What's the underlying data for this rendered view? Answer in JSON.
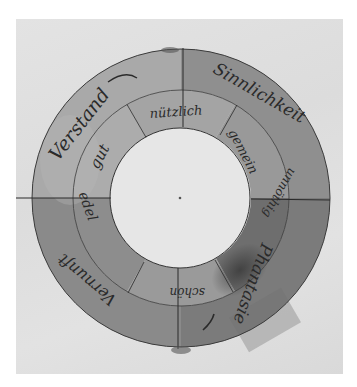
{
  "figure": {
    "center": [
      181,
      198
    ],
    "radii": {
      "inner": 70,
      "middle": 108,
      "outer": 149
    },
    "colors": {
      "paper": "#dfdfdf",
      "inner_hole": "#e6e6e6",
      "ink": "#2a2a2a"
    }
  },
  "outer_ring": {
    "labels": [
      {
        "id": "verstand",
        "text": "Verstand",
        "quadrant": "top-left",
        "shade": "#a9a9a9"
      },
      {
        "id": "sinnlichkeit",
        "text": "Sinnlichkeit",
        "quadrant": "top-right",
        "shade": "#8f8f8f"
      },
      {
        "id": "phantasie",
        "text": "Phantasie",
        "quadrant": "bottom-right",
        "shade": "#7b7b7b"
      },
      {
        "id": "vernunft",
        "text": "Vernunft",
        "quadrant": "bottom-left",
        "shade": "#8a8a8a"
      }
    ]
  },
  "inner_ring": {
    "labels": [
      {
        "id": "nuetzlich",
        "text": "nützlich",
        "position": "top",
        "shade": "#a4a4a4"
      },
      {
        "id": "gemein",
        "text": "gemein",
        "position": "upper-right",
        "shade": "#999999"
      },
      {
        "id": "unnoethig",
        "text": "unnöthig",
        "position": "lower-right",
        "shade": "#6e6e6e"
      },
      {
        "id": "schoen",
        "text": "schön",
        "position": "bottom",
        "shade": "#9a9a9a"
      },
      {
        "id": "edel",
        "text": "edel",
        "position": "lower-left",
        "shade": "#8d8d8d"
      },
      {
        "id": "gut",
        "text": "gut",
        "position": "upper-left",
        "shade": "#acacac"
      }
    ]
  }
}
